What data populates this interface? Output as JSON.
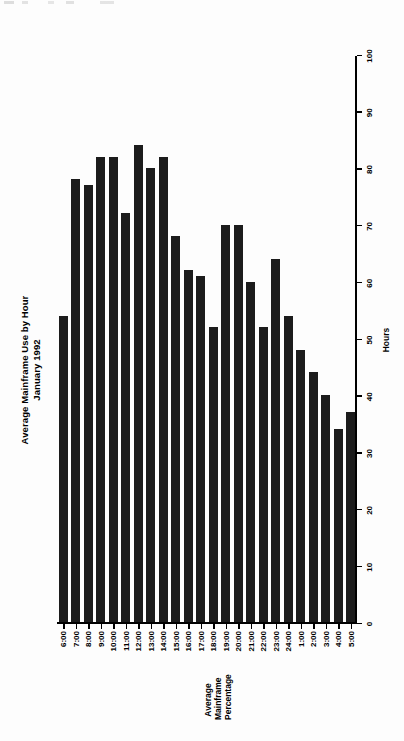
{
  "figure": {
    "title_line1": "Average Mainframe Use by Hour",
    "title_line2": "January 1992",
    "category_axis_label": "Hours",
    "value_axis_label": "Average Mainframe Percentage"
  },
  "chart_data": {
    "type": "bar",
    "orientation": "horizontal",
    "title": "Average Mainframe Use by Hour January 1992",
    "xlabel": "Hours",
    "ylabel": "Average Mainframe Percentage",
    "ylim": [
      0,
      100
    ],
    "yticks": [
      0,
      10,
      20,
      30,
      40,
      50,
      60,
      70,
      80,
      90,
      100
    ],
    "grid": false,
    "legend": false,
    "categories": [
      "6:00",
      "7:00",
      "8:00",
      "9:00",
      "10:00",
      "11:00",
      "12:00",
      "13:00",
      "14:00",
      "15:00",
      "16:00",
      "17:00",
      "18:00",
      "19:00",
      "20:00",
      "21:00",
      "22:00",
      "23:00",
      "24:00",
      "1:00",
      "2:00",
      "3:00",
      "4:00",
      "5:00"
    ],
    "values": [
      54,
      78,
      77,
      82,
      82,
      72,
      84,
      80,
      82,
      68,
      62,
      61,
      52,
      70,
      70,
      60,
      52,
      64,
      54,
      48,
      44,
      40,
      34,
      37
    ]
  },
  "ticklabels": {
    "values": [
      "100",
      "90",
      "80",
      "70",
      "60",
      "50",
      "40",
      "30",
      "20",
      "10",
      "0"
    ]
  }
}
